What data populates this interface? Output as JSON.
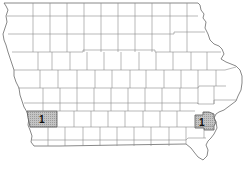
{
  "map": {
    "region": "Iowa",
    "subdivision": "counties",
    "highlight_color": "#b8b8b8",
    "line_color": "#8a8a8a",
    "highlighted_counties": [
      {
        "name": "Pottawattamie",
        "label": "1"
      },
      {
        "name": "Muscatine",
        "label": "1"
      }
    ]
  }
}
